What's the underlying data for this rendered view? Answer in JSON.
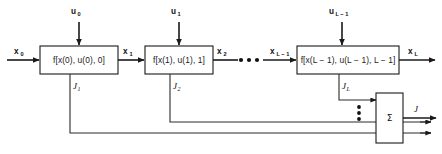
{
  "diagram": {
    "stroke_color": "#1a1a1a",
    "background_color": "#ffffff",
    "stages": [
      {
        "id": "stage-0",
        "block_label_prefix": "f[x(0), u(0), 0]",
        "block_label": "f[x(0), u(0), 0]",
        "control_input": "u",
        "control_input_sub": "0",
        "state_input": "x",
        "state_input_sub": "0",
        "state_output": "x",
        "state_output_sub": "1",
        "cost_label": "J",
        "cost_sub": "1"
      },
      {
        "id": "stage-1",
        "block_label": "f[x(1), u(1), 1]",
        "control_input": "u",
        "control_input_sub": "1",
        "state_output": "x",
        "state_output_sub": "2",
        "cost_label": "J",
        "cost_sub": "2"
      },
      {
        "id": "stage-last",
        "block_label": "f[x(L − 1), u(L − 1), L − 1]",
        "control_input": "u",
        "control_input_sub": "L − 1",
        "state_input": "x",
        "state_input_sub": "L − 1",
        "state_output": "x",
        "state_output_sub": "L",
        "cost_label": "J",
        "cost_sub": "L"
      }
    ],
    "ellipsis": {
      "horizontal": "•••",
      "vertical": "⋮"
    },
    "summation": {
      "symbol": "Σ",
      "output_label": "J"
    }
  }
}
